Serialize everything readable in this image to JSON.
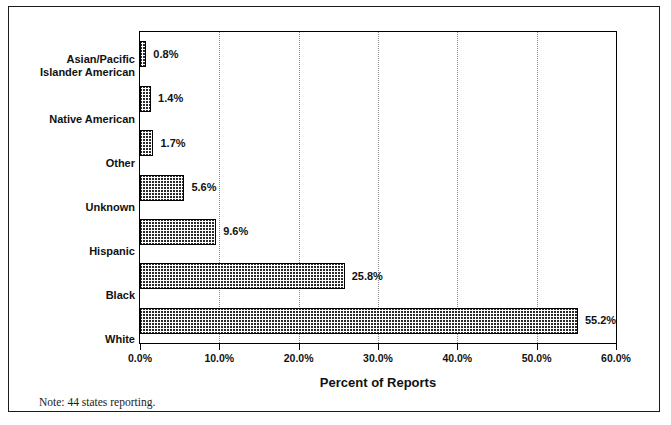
{
  "chart_data": {
    "type": "bar",
    "orientation": "horizontal",
    "title": "",
    "xlabel": "Percent of Reports",
    "ylabel": "",
    "xlim": [
      0,
      60
    ],
    "xtick_labels": [
      "0.0%",
      "10.0%",
      "20.0%",
      "30.0%",
      "40.0%",
      "50.0%",
      "60.0%"
    ],
    "xtick_values": [
      0,
      10,
      20,
      30,
      40,
      50,
      60
    ],
    "grid": "vertical-dotted",
    "legend": "none",
    "categories": [
      "Asian/Pacific Islander American",
      "Native American",
      "Other",
      "Unknown",
      "Hispanic",
      "Black",
      "White"
    ],
    "category_label_lines": [
      [
        "Asian/Pacific",
        "Islander American"
      ],
      [
        "Native American"
      ],
      [
        "Other"
      ],
      [
        "Unknown"
      ],
      [
        "Hispanic"
      ],
      [
        "Black"
      ],
      [
        "White"
      ]
    ],
    "values": [
      0.8,
      1.4,
      1.7,
      5.6,
      9.6,
      25.8,
      55.2
    ],
    "data_labels": [
      "0.8%",
      "1.4%",
      "1.7%",
      "5.6%",
      "9.6%",
      "25.8%",
      "55.2%"
    ],
    "note": "Note: 44 states reporting.",
    "bar_fill": "black-crosshatch",
    "bar_edge_color": "#000000",
    "background_color": "#ffffff"
  }
}
